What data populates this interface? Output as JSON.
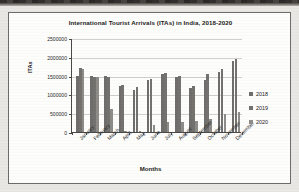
{
  "figure": {
    "title": "International Tourist Arrivals (ITAs) in India, 2018-2020",
    "xlabel": "Months",
    "ylabel": "ITAs"
  },
  "chart_data": {
    "type": "bar",
    "title": "International Tourist Arrivals (ITAs) in India, 2018-2020",
    "xlabel": "Months",
    "ylabel": "ITAs",
    "ylim": [
      0,
      2500000
    ],
    "yticks": [
      0,
      500000,
      1000000,
      1500000,
      2000000,
      2500000
    ],
    "ytick_labels": [
      "0",
      "500000",
      "1000000",
      "1500000",
      "2000000",
      "2500000"
    ],
    "grid": true,
    "legend_position": "right",
    "categories": [
      "January",
      "February",
      "March",
      "April",
      "May",
      "June",
      "July",
      "August",
      "September",
      "October",
      "November",
      "December"
    ],
    "series": [
      {
        "name": "2018",
        "values": [
          1480000,
          1480000,
          1500000,
          1230000,
          1130000,
          1390000,
          1550000,
          1470000,
          1180000,
          1390000,
          1590000,
          1890000
        ]
      },
      {
        "name": "2019",
        "values": [
          1700000,
          1470000,
          1450000,
          1250000,
          1200000,
          1400000,
          1560000,
          1480000,
          1220000,
          1540000,
          1680000,
          1940000
        ]
      },
      {
        "name": "2020",
        "values": [
          1680000,
          1470000,
          600000,
          20000,
          15000,
          180000,
          270000,
          270000,
          280000,
          340000,
          490000,
          530000
        ]
      }
    ]
  },
  "legend": {
    "entries": [
      {
        "label": "2018"
      },
      {
        "label": "2019"
      },
      {
        "label": "2020"
      }
    ]
  },
  "colors": {
    "series_2018": "#6f6e6c",
    "series_2019": "#74726f",
    "series_2020": "#8e8c89",
    "axis": "#4a4947",
    "grid": "#d2d0cd",
    "page": "#e9e7e4",
    "panel": "#fdfdfc"
  }
}
